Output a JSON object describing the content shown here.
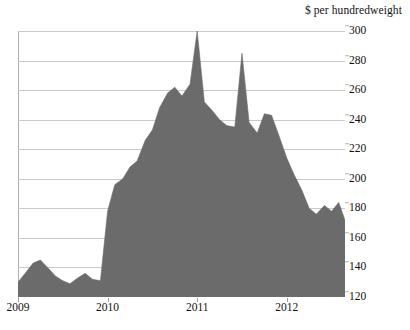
{
  "chart_data": {
    "type": "area",
    "title": "$ per hundredweight",
    "xlabel": "",
    "ylabel": "$ per hundredweight",
    "grid": true,
    "legend": "none",
    "ylim": [
      120,
      300
    ],
    "yticks": [
      120,
      140,
      160,
      180,
      200,
      220,
      240,
      260,
      280,
      300
    ],
    "xticks": [
      2009,
      2010,
      2011,
      2012
    ],
    "xtick_labels": [
      "2009",
      "2010",
      "2011",
      "2012"
    ],
    "xlim": [
      2009.0,
      2012.65
    ],
    "series_name": "Price",
    "x": [
      2009.0,
      2009.08,
      2009.17,
      2009.25,
      2009.33,
      2009.42,
      2009.5,
      2009.58,
      2009.67,
      2009.75,
      2009.83,
      2009.92,
      2010.0,
      2010.08,
      2010.17,
      2010.25,
      2010.33,
      2010.42,
      2010.5,
      2010.58,
      2010.67,
      2010.75,
      2010.83,
      2010.92,
      2011.0,
      2011.08,
      2011.17,
      2011.25,
      2011.33,
      2011.42,
      2011.5,
      2011.58,
      2011.67,
      2011.75,
      2011.83,
      2011.92,
      2012.0,
      2012.08,
      2012.17,
      2012.25,
      2012.33,
      2012.42,
      2012.5,
      2012.58,
      2012.65
    ],
    "values": [
      130,
      136,
      143,
      145,
      140,
      134,
      131,
      129,
      133,
      136,
      132,
      131,
      178,
      196,
      200,
      208,
      212,
      226,
      233,
      248,
      258,
      262,
      256,
      264,
      300,
      252,
      246,
      240,
      236,
      235,
      285,
      238,
      231,
      244,
      243,
      228,
      214,
      203,
      192,
      180,
      176,
      182,
      178,
      184,
      172
    ],
    "annotations": [
      {
        "label": "peak",
        "x": 2011.0,
        "y": 300
      },
      {
        "label": "second peak",
        "x": 2011.5,
        "y": 285
      }
    ],
    "colors": {
      "area_fill": "#6b6b6b",
      "gridline": "#c9c9c9",
      "axis": "#b0b0b0",
      "text": "#111111",
      "background": "#ffffff"
    }
  }
}
